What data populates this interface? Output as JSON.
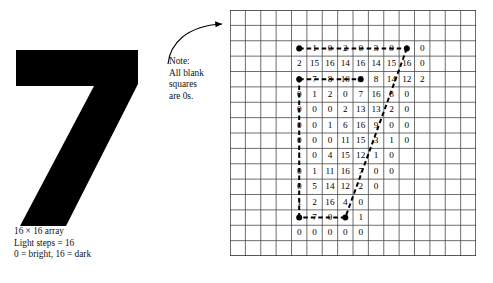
{
  "figure": {
    "digit": "7"
  },
  "caption": {
    "lines": [
      "16 × 16 array",
      "Light steps = 16",
      "0 = bright, 16 = dark"
    ],
    "line1": "16 × 16 array",
    "line2": "Light steps = 16",
    "line3": "0 = bright, 16 = dark"
  },
  "note": {
    "lines": [
      "Note:",
      "All blank",
      "squares",
      "are 0s."
    ],
    "line1": "Note:",
    "line2": "All blank",
    "line3": "squares",
    "line4": "are 0s."
  },
  "grid": {
    "rows": 16,
    "cols": 16,
    "cell_px": 15.375,
    "line_color": "#4a4a4a",
    "border_color": "#222222"
  },
  "chart_data": {
    "type": "heatmap",
    "title": "16 × 16 array",
    "xlabel": "",
    "ylabel": "",
    "rows": 16,
    "cols": 16,
    "value_range": [
      0,
      16
    ],
    "legend": [
      "0 = bright",
      "16 = dark"
    ],
    "blank_means": 0,
    "cells": [
      {
        "row": 2,
        "col": 4,
        "values": [
          0,
          1,
          0,
          2,
          0,
          3,
          0,
          1,
          0
        ]
      },
      {
        "row": 3,
        "col": 4,
        "values": [
          2,
          15,
          16,
          14,
          16,
          14,
          15,
          16,
          0
        ]
      },
      {
        "row": 4,
        "col": 4,
        "values": [
          1,
          7,
          8,
          10,
          8,
          8,
          14,
          12,
          2
        ]
      },
      {
        "row": 5,
        "col": 4,
        "values": [
          0,
          1,
          2,
          0,
          7,
          16,
          8,
          0
        ]
      },
      {
        "row": 6,
        "col": 4,
        "values": [
          0,
          0,
          0,
          2,
          13,
          13,
          2,
          0
        ]
      },
      {
        "row": 7,
        "col": 4,
        "values": [
          0,
          0,
          1,
          6,
          16,
          9,
          0,
          0
        ]
      },
      {
        "row": 8,
        "col": 4,
        "values": [
          0,
          0,
          0,
          11,
          15,
          3,
          1,
          0
        ]
      },
      {
        "row": 9,
        "col": 4,
        "values": [
          1,
          0,
          4,
          15,
          12,
          1,
          0
        ]
      },
      {
        "row": 10,
        "col": 4,
        "values": [
          0,
          1,
          11,
          16,
          7,
          0,
          0
        ]
      },
      {
        "row": 11,
        "col": 4,
        "values": [
          0,
          5,
          14,
          12,
          2,
          0
        ]
      },
      {
        "row": 12,
        "col": 4,
        "values": [
          1,
          2,
          16,
          4,
          0
        ]
      },
      {
        "row": 13,
        "col": 4,
        "values": [
          1,
          7,
          0,
          4,
          1
        ]
      },
      {
        "row": 14,
        "col": 4,
        "values": [
          0,
          0,
          0,
          0,
          0
        ]
      }
    ],
    "annotation_path": {
      "description": "dashed polyline with dot vertices tracing the stroke of the digit 7",
      "vertices": [
        {
          "row": 2,
          "col": 4
        },
        {
          "row": 2,
          "col": 11
        },
        {
          "row": 13,
          "col": 7
        },
        {
          "row": 13,
          "col": 4
        },
        {
          "row": 4,
          "col": 4
        },
        {
          "row": 4,
          "col": 8
        }
      ]
    }
  }
}
